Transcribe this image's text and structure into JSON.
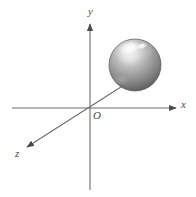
{
  "figure": {
    "background_color": "#ffffff",
    "width": 196,
    "height": 197
  },
  "axes": {
    "line_color": "#6e6e6e",
    "origin": {
      "label": "O",
      "x": 90,
      "y": 108
    },
    "x_axis": {
      "label": "x",
      "from": {
        "x": 12,
        "y": 108
      },
      "to": {
        "x": 178,
        "y": 108
      },
      "arrow": "right"
    },
    "y_axis": {
      "label": "y",
      "from": {
        "x": 90,
        "y": 190
      },
      "to": {
        "x": 90,
        "y": 22
      },
      "arrow": "up"
    },
    "z_axis": {
      "label": "z",
      "from": {
        "x": 122,
        "y": 86
      },
      "to": {
        "x": 25,
        "y": 148
      },
      "arrow": "down-left"
    }
  },
  "sphere": {
    "name": "shaded-sphere",
    "center": {
      "x": 135,
      "y": 65
    },
    "radius": 26,
    "fill_light": "#f2f2f2",
    "fill_mid": "#9a9a9a",
    "fill_dark": "#4d4d4d",
    "highlight_color": "#ffffff",
    "outline_color": "#555555"
  }
}
